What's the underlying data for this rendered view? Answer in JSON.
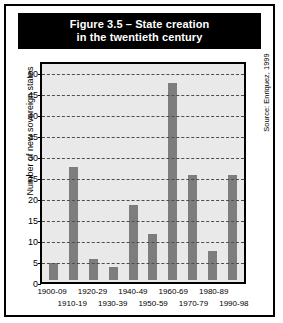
{
  "figure": {
    "title_line1": "Figure 3.5 – State creation",
    "title_line2": "in the twentieth century",
    "source": "Source: Enriquez, 1999"
  },
  "chart_data": {
    "type": "bar",
    "title": "Figure 3.5 – State creation in the twentieth century",
    "xlabel": "",
    "ylabel": "Number of new sovereign states",
    "categories": [
      "1900-09",
      "1910-19",
      "1920-29",
      "1930-39",
      "1940-49",
      "1950-59",
      "1960-69",
      "1970-79",
      "1980-89",
      "1990-98"
    ],
    "values": [
      4,
      27,
      5,
      3,
      18,
      11,
      47,
      25,
      7,
      25
    ],
    "ylim": [
      0,
      52
    ],
    "yticks": [
      0,
      5,
      10,
      15,
      20,
      25,
      30,
      35,
      40,
      45,
      50
    ],
    "ytick_labels": [
      "0",
      "5",
      "10",
      "15",
      "20",
      "25",
      "30",
      "35",
      "40",
      "45",
      "50"
    ],
    "grid": true,
    "legend": "none",
    "bar_color": "#7d7d7d",
    "plot_background": "#e9e9e9",
    "annotations": [
      "Source: Enriquez, 1999"
    ]
  }
}
